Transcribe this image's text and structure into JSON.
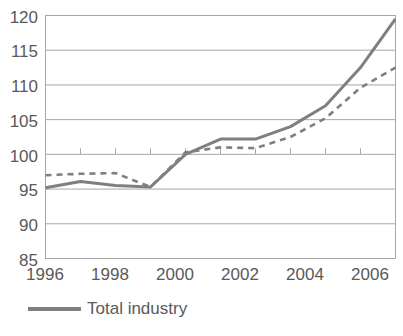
{
  "chart_data": {
    "type": "line",
    "title": "",
    "subtitle": "",
    "xlabel": "",
    "ylabel": "",
    "x": [
      1996,
      1997,
      1998,
      1999,
      2000,
      2001,
      2002,
      2003,
      2004,
      2005,
      2006
    ],
    "xlim": [
      1996,
      2006
    ],
    "ylim": [
      85,
      120
    ],
    "grid": true,
    "grid_axis": "y",
    "legend_position": "bottom-left",
    "series": [
      {
        "name": "Total industry",
        "style": "solid",
        "color": "#7f7f7f",
        "values": [
          95.2,
          96.1,
          95.5,
          95.3,
          100.0,
          102.2,
          102.2,
          104.0,
          107.0,
          112.5,
          119.5
        ]
      },
      {
        "name": "",
        "style": "dashed",
        "color": "#7f7f7f",
        "values": [
          97.0,
          97.2,
          97.3,
          95.3,
          100.3,
          101.0,
          100.9,
          102.5,
          105.2,
          109.6,
          112.5
        ]
      }
    ],
    "y_ticks": [
      85,
      90,
      95,
      100,
      105,
      110,
      115,
      120
    ],
    "y_tick_labels": [
      "85",
      "90",
      "95",
      "100",
      "105",
      "110",
      "115",
      "120"
    ],
    "x_ticks": [
      1996,
      1998,
      2000,
      2002,
      2004,
      2006
    ],
    "x_tick_labels": [
      "1996",
      "1998",
      "2000",
      "2002",
      "2004",
      "2006"
    ],
    "x_minor_ticks": [
      1996,
      1997,
      1998,
      1999,
      2000,
      2001,
      2002,
      2003,
      2004,
      2005,
      2006
    ],
    "axis_line_value": 100,
    "colors": {
      "line": "#7f7f7f",
      "grid": "#a6a6a6",
      "frame": "#a6a6a6",
      "text": "#595959",
      "background": "#ffffff"
    }
  },
  "legend": {
    "items": [
      {
        "label": "Total industry",
        "style": "solid",
        "color": "#7f7f7f"
      }
    ]
  }
}
